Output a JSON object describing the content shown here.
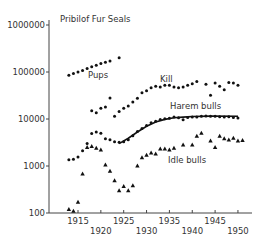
{
  "chart_data": {
    "type": "scatter",
    "title": "Pribilof Fur Seals",
    "xlabel": "",
    "ylabel": "",
    "yscale": "log",
    "ylim": [
      100,
      1000000
    ],
    "xlim": [
      1911,
      1953
    ],
    "grid": false,
    "legend": "inline labels",
    "y_ticks": [
      {
        "value": 1000000,
        "label": "1000000"
      },
      {
        "value": 100000,
        "label": "100000"
      },
      {
        "value": 10000,
        "label": "10000"
      },
      {
        "value": 1000,
        "label": "1000"
      },
      {
        "value": 100,
        "label": "100"
      }
    ],
    "x_ticks": [
      {
        "value": 1915,
        "label": "1915",
        "row": 1
      },
      {
        "value": 1920,
        "label": "1920",
        "row": 2
      },
      {
        "value": 1925,
        "label": "1925",
        "row": 1
      },
      {
        "value": 1930,
        "label": "1930",
        "row": 2
      },
      {
        "value": 1935,
        "label": "1935",
        "row": 1
      },
      {
        "value": 1940,
        "label": "1940",
        "row": 2
      },
      {
        "value": 1945,
        "label": "1945",
        "row": 1
      },
      {
        "value": 1950,
        "label": "1950",
        "row": 2
      }
    ],
    "series": [
      {
        "name": "Pups",
        "marker": "dot",
        "label_pos": {
          "x": 88,
          "y": 78
        },
        "points": [
          [
            1913,
            85000
          ],
          [
            1914,
            93000
          ],
          [
            1915,
            100000
          ],
          [
            1916,
            108000
          ],
          [
            1917,
            118000
          ],
          [
            1918,
            130000
          ],
          [
            1919,
            140000
          ],
          [
            1920,
            152000
          ],
          [
            1921,
            162000
          ],
          [
            1922,
            172000
          ],
          [
            1924,
            200000
          ]
        ]
      },
      {
        "name": "Kill",
        "marker": "dot",
        "label_pos": {
          "x": 160,
          "y": 82
        },
        "points": [
          [
            1918,
            15000
          ],
          [
            1919,
            13500
          ],
          [
            1920,
            17000
          ],
          [
            1921,
            18000
          ],
          [
            1922,
            28000
          ],
          [
            1923,
            11500
          ],
          [
            1924,
            14500
          ],
          [
            1925,
            17000
          ],
          [
            1926,
            19000
          ],
          [
            1927,
            23000
          ],
          [
            1928,
            27500
          ],
          [
            1929,
            36000
          ],
          [
            1930,
            40000
          ],
          [
            1931,
            46000
          ],
          [
            1932,
            50000
          ],
          [
            1933,
            48000
          ],
          [
            1934,
            52000
          ],
          [
            1935,
            52000
          ],
          [
            1936,
            48000
          ],
          [
            1937,
            46000
          ],
          [
            1938,
            48000
          ],
          [
            1939,
            52000
          ],
          [
            1940,
            56000
          ],
          [
            1941,
            63000
          ],
          [
            1943,
            55000
          ],
          [
            1944,
            32000
          ],
          [
            1945,
            58000
          ],
          [
            1946,
            50000
          ],
          [
            1947,
            42000
          ],
          [
            1948,
            60000
          ],
          [
            1949,
            58000
          ],
          [
            1950,
            52000
          ]
        ]
      },
      {
        "name": "Harem bulls",
        "marker": "dot",
        "fit_line": true,
        "label_pos": {
          "x": 170,
          "y": 109
        },
        "points": [
          [
            1913,
            1350
          ],
          [
            1914,
            1400
          ],
          [
            1915,
            1550
          ],
          [
            1916,
            2100
          ],
          [
            1917,
            3000
          ],
          [
            1918,
            4900
          ],
          [
            1919,
            5300
          ],
          [
            1920,
            5000
          ],
          [
            1921,
            3800
          ],
          [
            1922,
            3600
          ],
          [
            1923,
            3300
          ],
          [
            1924,
            3200
          ],
          [
            1925,
            3300
          ],
          [
            1926,
            3600
          ],
          [
            1927,
            4400
          ],
          [
            1928,
            5400
          ],
          [
            1929,
            6300
          ],
          [
            1930,
            7300
          ],
          [
            1931,
            8300
          ],
          [
            1932,
            9000
          ],
          [
            1933,
            9800
          ],
          [
            1934,
            10100
          ],
          [
            1935,
            10400
          ],
          [
            1936,
            11000
          ],
          [
            1937,
            10600
          ],
          [
            1938,
            9600
          ],
          [
            1939,
            10800
          ],
          [
            1940,
            11000
          ],
          [
            1941,
            11000
          ],
          [
            1942,
            11500
          ],
          [
            1943,
            11600
          ],
          [
            1944,
            11500
          ],
          [
            1945,
            11500
          ],
          [
            1946,
            11200
          ],
          [
            1947,
            11000
          ],
          [
            1948,
            11200
          ],
          [
            1949,
            10800
          ],
          [
            1950,
            10500
          ]
        ],
        "fit": [
          [
            1924,
            3000
          ],
          [
            1926,
            3900
          ],
          [
            1928,
            5300
          ],
          [
            1930,
            7000
          ],
          [
            1932,
            8600
          ],
          [
            1934,
            9800
          ],
          [
            1936,
            10600
          ],
          [
            1938,
            11000
          ],
          [
            1940,
            11300
          ],
          [
            1944,
            11500
          ],
          [
            1950,
            11400
          ]
        ]
      },
      {
        "name": "Idle bulls",
        "marker": "triangle",
        "label_pos": {
          "x": 168,
          "y": 163
        },
        "points": [
          [
            1913,
            120
          ],
          [
            1914,
            110
          ],
          [
            1915,
            170
          ],
          [
            1916,
            680
          ],
          [
            1917,
            2500
          ],
          [
            1918,
            2600
          ],
          [
            1919,
            2400
          ],
          [
            1920,
            2200
          ],
          [
            1921,
            1050
          ],
          [
            1922,
            780
          ],
          [
            1923,
            490
          ],
          [
            1924,
            300
          ],
          [
            1925,
            370
          ],
          [
            1926,
            300
          ],
          [
            1927,
            380
          ],
          [
            1928,
            1000
          ],
          [
            1929,
            1500
          ],
          [
            1930,
            1700
          ],
          [
            1931,
            1900
          ],
          [
            1932,
            1800
          ],
          [
            1933,
            2300
          ],
          [
            1934,
            2300
          ],
          [
            1935,
            2200
          ],
          [
            1936,
            2400
          ],
          [
            1938,
            2800
          ],
          [
            1940,
            2800
          ],
          [
            1941,
            4300
          ],
          [
            1942,
            5000
          ],
          [
            1944,
            3400
          ],
          [
            1945,
            2500
          ],
          [
            1946,
            4300
          ],
          [
            1947,
            3800
          ],
          [
            1948,
            3600
          ],
          [
            1949,
            3900
          ],
          [
            1950,
            3400
          ],
          [
            1951,
            3500
          ]
        ]
      }
    ]
  }
}
